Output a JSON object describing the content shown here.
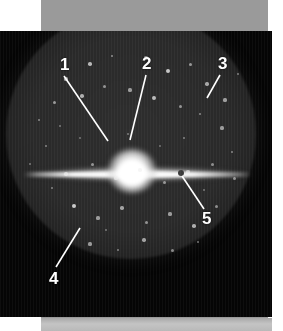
{
  "figure": {
    "kind": "astronomical-photograph",
    "background_color": "#050505",
    "mount_color": "#9a9a9a",
    "page_color": "#ffffff",
    "label_color": "#ffffff",
    "leader_color": "#ffffff"
  },
  "annotations": [
    {
      "id": "1",
      "label": "1",
      "x": 60,
      "y": 56,
      "leader": {
        "x1": 64,
        "y1": 76,
        "x2": 108,
        "y2": 141
      }
    },
    {
      "id": "2",
      "label": "2",
      "x": 142,
      "y": 55,
      "leader": {
        "x1": 146,
        "y1": 75,
        "x2": 130,
        "y2": 140
      }
    },
    {
      "id": "3",
      "label": "3",
      "x": 218,
      "y": 55,
      "leader": {
        "x1": 220,
        "y1": 75,
        "x2": 207,
        "y2": 98
      }
    },
    {
      "id": "4",
      "label": "4",
      "x": 49,
      "y": 270,
      "leader": {
        "x1": 56,
        "y1": 267,
        "x2": 80,
        "y2": 228
      }
    },
    {
      "id": "5",
      "label": "5",
      "x": 202,
      "y": 210,
      "leader": {
        "x1": 204,
        "y1": 209,
        "x2": 182,
        "y2": 176
      }
    }
  ],
  "galaxy": {
    "core_center": {
      "x": 131,
      "y": 175
    },
    "disk_extent": {
      "x_left": 32,
      "x_right": 252,
      "y": 175
    },
    "dust_spot": {
      "x": 184,
      "y": 176
    }
  },
  "field_of_view": {
    "center": {
      "x": 131,
      "y": 134
    },
    "radius": 125,
    "shape": "circle"
  },
  "stars": [
    {
      "x": 72,
      "y": 101,
      "r": 1.6,
      "b": 0.6
    },
    {
      "x": 96,
      "y": 86,
      "r": 1.8,
      "b": 0.7
    },
    {
      "x": 118,
      "y": 78,
      "r": 1.4,
      "b": 0.5
    },
    {
      "x": 152,
      "y": 80,
      "r": 1.6,
      "b": 0.62
    },
    {
      "x": 174,
      "y": 93,
      "r": 2.0,
      "b": 0.78
    },
    {
      "x": 196,
      "y": 86,
      "r": 1.5,
      "b": 0.55
    },
    {
      "x": 213,
      "y": 106,
      "r": 1.7,
      "b": 0.62
    },
    {
      "x": 231,
      "y": 122,
      "r": 1.6,
      "b": 0.58
    },
    {
      "x": 60,
      "y": 124,
      "r": 1.5,
      "b": 0.55
    },
    {
      "x": 45,
      "y": 142,
      "r": 1.4,
      "b": 0.48
    },
    {
      "x": 88,
      "y": 118,
      "r": 1.8,
      "b": 0.66
    },
    {
      "x": 110,
      "y": 108,
      "r": 1.5,
      "b": 0.52
    },
    {
      "x": 136,
      "y": 112,
      "r": 1.6,
      "b": 0.56
    },
    {
      "x": 160,
      "y": 120,
      "r": 1.9,
      "b": 0.72
    },
    {
      "x": 186,
      "y": 128,
      "r": 1.5,
      "b": 0.52
    },
    {
      "x": 206,
      "y": 136,
      "r": 1.4,
      "b": 0.48
    },
    {
      "x": 228,
      "y": 150,
      "r": 1.6,
      "b": 0.56
    },
    {
      "x": 52,
      "y": 168,
      "r": 1.4,
      "b": 0.46
    },
    {
      "x": 72,
      "y": 196,
      "r": 1.7,
      "b": 0.6
    },
    {
      "x": 98,
      "y": 186,
      "r": 1.5,
      "b": 0.52
    },
    {
      "x": 122,
      "y": 200,
      "r": 1.6,
      "b": 0.58
    },
    {
      "x": 146,
      "y": 192,
      "r": 1.8,
      "b": 0.68
    },
    {
      "x": 170,
      "y": 204,
      "r": 1.5,
      "b": 0.52
    },
    {
      "x": 194,
      "y": 194,
      "r": 1.6,
      "b": 0.56
    },
    {
      "x": 218,
      "y": 186,
      "r": 1.5,
      "b": 0.5
    },
    {
      "x": 238,
      "y": 174,
      "r": 1.4,
      "b": 0.46
    },
    {
      "x": 80,
      "y": 228,
      "r": 2.0,
      "b": 0.8
    },
    {
      "x": 104,
      "y": 240,
      "r": 1.6,
      "b": 0.56
    },
    {
      "x": 128,
      "y": 230,
      "r": 1.7,
      "b": 0.6
    },
    {
      "x": 152,
      "y": 244,
      "r": 1.5,
      "b": 0.52
    },
    {
      "x": 176,
      "y": 236,
      "r": 1.6,
      "b": 0.56
    },
    {
      "x": 200,
      "y": 248,
      "r": 1.8,
      "b": 0.66
    },
    {
      "x": 222,
      "y": 228,
      "r": 1.5,
      "b": 0.5
    },
    {
      "x": 96,
      "y": 266,
      "r": 1.6,
      "b": 0.56
    },
    {
      "x": 124,
      "y": 272,
      "r": 1.4,
      "b": 0.46
    },
    {
      "x": 150,
      "y": 262,
      "r": 1.7,
      "b": 0.6
    },
    {
      "x": 178,
      "y": 272,
      "r": 1.5,
      "b": 0.5
    },
    {
      "x": 204,
      "y": 264,
      "r": 1.4,
      "b": 0.46
    },
    {
      "x": 66,
      "y": 148,
      "r": 1.3,
      "b": 0.4
    },
    {
      "x": 240,
      "y": 200,
      "r": 1.5,
      "b": 0.5
    },
    {
      "x": 36,
      "y": 186,
      "r": 1.3,
      "b": 0.4
    },
    {
      "x": 244,
      "y": 96,
      "r": 1.4,
      "b": 0.44
    },
    {
      "x": 134,
      "y": 156,
      "r": 1.3,
      "b": 0.4
    },
    {
      "x": 190,
      "y": 160,
      "r": 1.4,
      "b": 0.44
    },
    {
      "x": 86,
      "y": 160,
      "r": 1.3,
      "b": 0.38
    },
    {
      "x": 166,
      "y": 168,
      "r": 1.2,
      "b": 0.36
    },
    {
      "x": 112,
      "y": 252,
      "r": 1.3,
      "b": 0.4
    },
    {
      "x": 58,
      "y": 210,
      "r": 1.4,
      "b": 0.44
    },
    {
      "x": 210,
      "y": 212,
      "r": 1.3,
      "b": 0.38
    }
  ]
}
